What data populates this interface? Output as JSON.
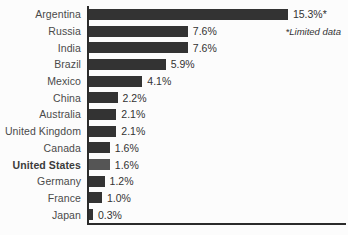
{
  "chart_data": {
    "type": "bar",
    "orientation": "horizontal",
    "title": "",
    "xlabel": "",
    "ylabel": "",
    "categories": [
      "Argentina",
      "Russia",
      "India",
      "Brazil",
      "Mexico",
      "China",
      "Australia",
      "United Kingdom",
      "Canada",
      "United States",
      "Germany",
      "France",
      "Japan"
    ],
    "values": [
      15.3,
      7.6,
      7.6,
      5.9,
      4.1,
      2.2,
      2.1,
      2.1,
      1.6,
      1.6,
      1.2,
      1.0,
      0.3
    ],
    "value_labels": [
      "15.3%*",
      "7.6%",
      "7.6%",
      "5.9%",
      "4.1%",
      "2.2%",
      "2.1%",
      "2.1%",
      "1.6%",
      "1.6%",
      "1.2%",
      "1.0%",
      "0.3%"
    ],
    "highlighted_category": "United States",
    "annotation": "*Limited data",
    "xlim": [
      0,
      20
    ],
    "grid": false,
    "legend": false,
    "bar_color": "#333333",
    "highlight_bar_color": "#555555",
    "axis_color": "#2b2b2b"
  }
}
